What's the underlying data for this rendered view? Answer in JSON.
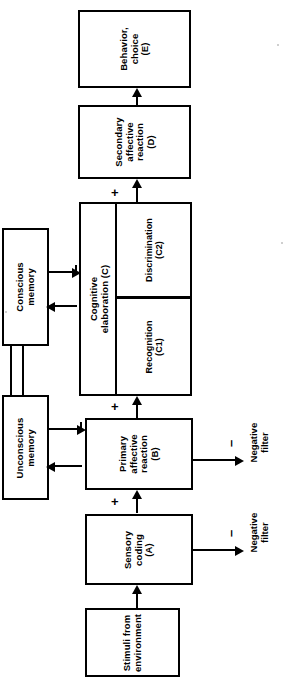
{
  "diagram": {
    "orientation": "rotated-90",
    "nodes": {
      "behavior": {
        "label": "Behavior,\nchoice\n(E)",
        "line1": "Behavior,",
        "line2": "choice",
        "line3": "(E)"
      },
      "secondary": {
        "label": "Secondary\naffective\nreaction\n(D)",
        "line1": "Secondary",
        "line2": "affective",
        "line3": "reaction",
        "line4": "(D)"
      },
      "cognitive": {
        "line1": "Cognitive",
        "line2": "elaboration (C)"
      },
      "discrimination": {
        "line1": "Discrimination",
        "line2": "(C2)"
      },
      "recognition": {
        "line1": "Recognition",
        "line2": "(C1)"
      },
      "conscious_memory": {
        "line1": "Conscious",
        "line2": "memory"
      },
      "unconscious_memory": {
        "line1": "Unconscious",
        "line2": "memory"
      },
      "primary": {
        "line1": "Primary",
        "line2": "affective",
        "line3": "reaction",
        "line4": "(B)"
      },
      "sensory": {
        "line1": "Sensory",
        "line2": "coding",
        "line3": "(A)"
      },
      "stimuli": {
        "line1": "Stimuli from",
        "line2": "environment"
      },
      "negative_filter_b": {
        "line1": "Negative",
        "line2": "filter"
      },
      "negative_filter_a": {
        "line1": "Negative",
        "line2": "filter"
      }
    },
    "signs": {
      "plus_c_to_d": "+",
      "plus_b_to_c": "+",
      "plus_a_to_b": "+",
      "minus_b_filter": "–",
      "minus_a_filter": "–"
    },
    "colors": {
      "stroke": "#000000",
      "background": "#ffffff",
      "text": "#000000"
    }
  }
}
